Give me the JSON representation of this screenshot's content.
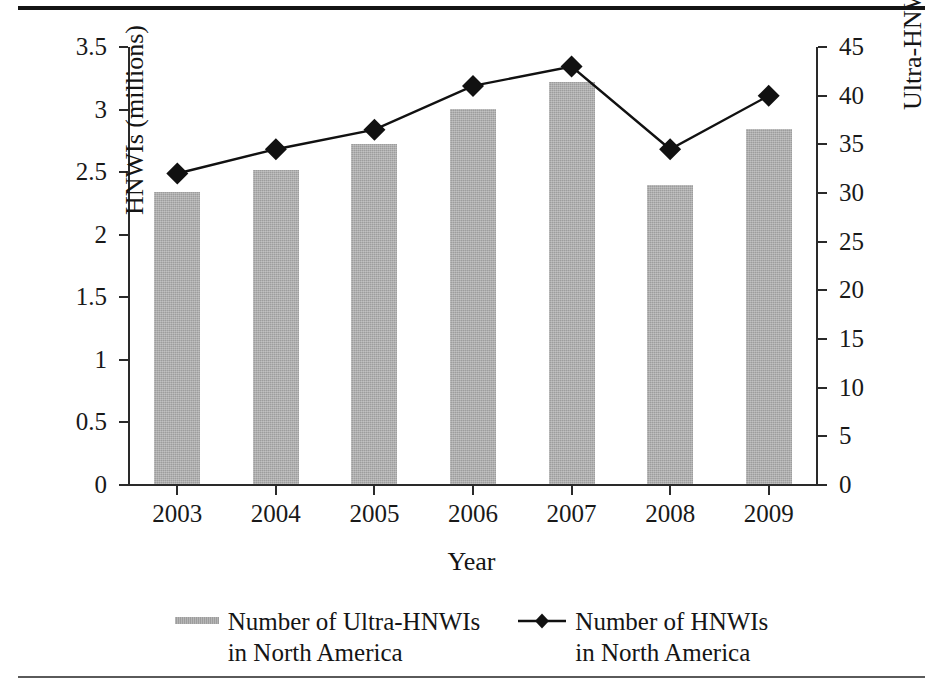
{
  "chart_data": {
    "type": "bar",
    "title": "",
    "xlabel": "Year",
    "categories": [
      "2003",
      "2004",
      "2005",
      "2006",
      "2007",
      "2008",
      "2009"
    ],
    "grid": false,
    "legend_position": "bottom",
    "series": [
      {
        "name": "Number of Ultra-HNWIs\nin North America",
        "type": "bar",
        "axis": "left",
        "unit": "millions",
        "color": "#9d9d9d",
        "values": [
          2.33,
          2.51,
          2.72,
          3.0,
          3.21,
          2.39,
          2.84
        ]
      },
      {
        "name": "Number of HNWIs\nin North America",
        "type": "line",
        "axis": "right",
        "unit": "thousands",
        "color": "#111111",
        "marker": "diamond",
        "values": [
          32.0,
          34.5,
          36.5,
          41.0,
          43.0,
          34.5,
          40.0
        ]
      }
    ],
    "left_axis": {
      "label": "HNWIs (millions)",
      "ylim": [
        0,
        3.5
      ],
      "ticks": [
        "0",
        "0.5",
        "1",
        "1.5",
        "2",
        "2.5",
        "3",
        "3.5"
      ],
      "tick_values": [
        0,
        0.5,
        1,
        1.5,
        2,
        2.5,
        3,
        3.5
      ]
    },
    "right_axis": {
      "label": "Ultra-HNWIs (thousands)",
      "ylim": [
        0,
        45
      ],
      "ticks": [
        "0",
        "5",
        "10",
        "15",
        "20",
        "25",
        "30",
        "35",
        "40",
        "45"
      ],
      "tick_values": [
        0,
        5,
        10,
        15,
        20,
        25,
        30,
        35,
        40,
        45
      ]
    }
  },
  "axes": {
    "left_title": "HNWIs (millions)",
    "right_title": "Ultra-HNWIs (thousands)",
    "x_title": "Year"
  },
  "legend": {
    "items": [
      {
        "label": "Number of Ultra-HNWIs\nin North America",
        "marker": "bar-swatch"
      },
      {
        "label": "Number of HNWIs\nin North America",
        "marker": "line-diamond-swatch"
      }
    ]
  }
}
